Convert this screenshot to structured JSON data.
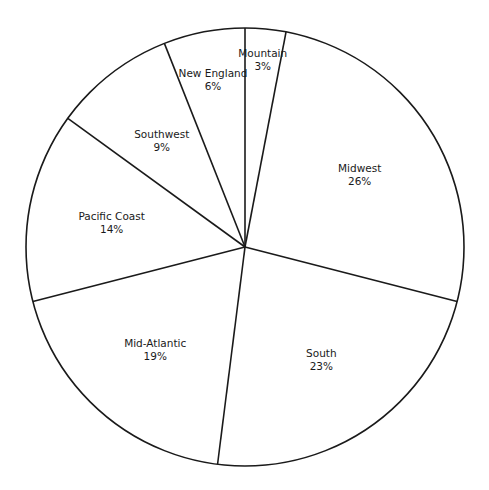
{
  "chart_data": {
    "type": "pie",
    "title": "",
    "start_angle": "12 o'clock",
    "direction": "clockwise",
    "categories": [
      "Mountain",
      "Midwest",
      "South",
      "Mid-Atlantic",
      "Pacific Coast",
      "Southwest",
      "New England"
    ],
    "values": [
      3,
      26,
      23,
      19,
      14,
      9,
      6
    ],
    "labels": [
      "3%",
      "26%",
      "23%",
      "19%",
      "14%",
      "9%",
      "6%"
    ],
    "colors": {
      "fill": "#ffffff",
      "stroke": "#1a1a1a"
    }
  }
}
